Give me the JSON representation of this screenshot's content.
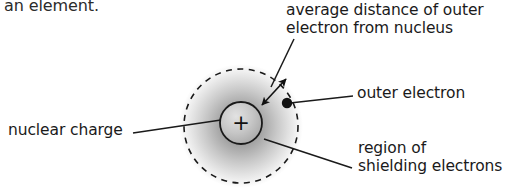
{
  "figure": {
    "kind": "science-diagram",
    "width": 528,
    "height": 192,
    "background_color": "#ffffff",
    "caption_fragment": "an element.",
    "labels": {
      "average_distance_line1": "average distance of outer",
      "average_distance_line2": "electron from nucleus",
      "outer_electron": "outer electron",
      "region_shielding_line1": "region of",
      "region_shielding_line2": "shielding electrons",
      "nuclear_charge": "nuclear charge"
    },
    "nucleus": {
      "symbol": "+",
      "center_x": 241,
      "center_y": 123,
      "radius": 21,
      "fill_color": "#c9c9c9",
      "stroke_color": "#1a1a1a"
    },
    "electron_cloud": {
      "center_x": 241,
      "center_y": 126,
      "radius": 57,
      "inner_color": "#8c8c8c",
      "outer_color": "#ffffff",
      "boundary_style": "dashed",
      "boundary_color": "#1a1a1a"
    },
    "outer_electron_dot": {
      "center_x": 287,
      "center_y": 103,
      "radius": 5,
      "color": "#111111"
    },
    "leader_lines": [
      {
        "name": "average-distance-leader",
        "x1": 293,
        "y1": 40,
        "x2": 271,
        "y2": 86
      },
      {
        "name": "radius-arrow",
        "x1": 260,
        "y1": 103,
        "x2": 285,
        "y2": 80,
        "arrowheads": "both"
      },
      {
        "name": "outer-electron-leader",
        "x1": 292,
        "y1": 103,
        "x2": 353,
        "y2": 96
      },
      {
        "name": "region-shielding-leader",
        "x1": 264,
        "y1": 139,
        "x2": 352,
        "y2": 168
      },
      {
        "name": "nuclear-charge-leader",
        "x1": 133,
        "y1": 133,
        "x2": 221,
        "y2": 120
      }
    ]
  }
}
